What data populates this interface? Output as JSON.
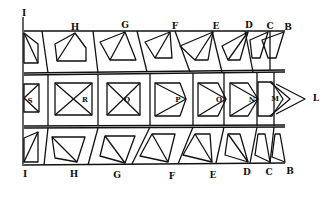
{
  "figure": {
    "top_labels": [
      "I",
      "H",
      "G",
      "F",
      "E",
      "D",
      "C",
      "B"
    ],
    "middle_labels": [
      "S",
      "R",
      "Q",
      "P",
      "O",
      "N",
      "M",
      "L"
    ],
    "bottom_labels": [
      "I",
      "H",
      "G",
      "F",
      "E",
      "D",
      "C",
      "B"
    ],
    "ink_color": "#111111",
    "paper_color": "#ffffff"
  }
}
